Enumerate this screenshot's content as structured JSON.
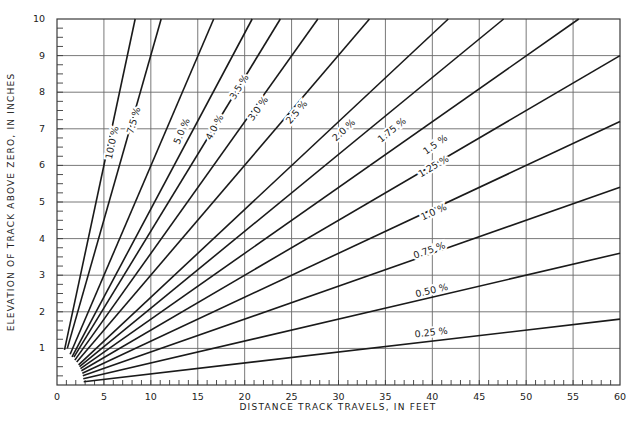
{
  "chart_data": {
    "type": "line",
    "title": "",
    "xlabel": "DISTANCE TRACK TRAVELS, IN FEET",
    "ylabel": "ELEVATION OF TRACK ABOVE ZERO, IN INCHES",
    "xlim": [
      0,
      60
    ],
    "ylim": [
      0,
      10
    ],
    "x_ticks": [
      0,
      5,
      10,
      15,
      20,
      25,
      30,
      35,
      40,
      45,
      50,
      55,
      60
    ],
    "y_ticks": [
      1,
      2,
      3,
      4,
      5,
      6,
      7,
      8,
      9,
      10
    ],
    "x_minor_step": 1,
    "y_minor_step": 0.25,
    "grid": true,
    "legend": "inline labels along lines",
    "relationship": "elevation_in = grade_pct / 100 * distance_ft * 12",
    "series": [
      {
        "name": "10.0 %",
        "grade": 10.0,
        "x": [
          0.8,
          8.33
        ],
        "y": [
          0.96,
          10.0
        ],
        "label_at": [
          6.2,
          6.6
        ]
      },
      {
        "name": "7.5 %",
        "grade": 7.5,
        "x": [
          1.1,
          11.1
        ],
        "y": [
          1.0,
          10.0
        ],
        "label_at": [
          8.5,
          7.2
        ]
      },
      {
        "name": "5.0 %",
        "grade": 5.0,
        "x": [
          1.4,
          16.7
        ],
        "y": [
          0.84,
          10.0
        ],
        "label_at": [
          13.6,
          6.9
        ]
      },
      {
        "name": "4.0 %",
        "grade": 4.0,
        "x": [
          1.6,
          20.8
        ],
        "y": [
          0.77,
          10.0
        ],
        "label_at": [
          17.1,
          7.0
        ]
      },
      {
        "name": "3.5 %",
        "grade": 3.5,
        "x": [
          1.8,
          23.8
        ],
        "y": [
          0.76,
          10.0
        ],
        "label_at": [
          19.7,
          8.1
        ]
      },
      {
        "name": "3.0 %",
        "grade": 3.0,
        "x": [
          1.9,
          27.8
        ],
        "y": [
          0.68,
          10.0
        ],
        "label_at": [
          21.7,
          7.5
        ]
      },
      {
        "name": "2.5 %",
        "grade": 2.5,
        "x": [
          2.1,
          33.3
        ],
        "y": [
          0.63,
          10.0
        ],
        "label_at": [
          25.8,
          7.4
        ]
      },
      {
        "name": "2.0 %",
        "grade": 2.0,
        "x": [
          2.3,
          41.7
        ],
        "y": [
          0.55,
          10.0
        ],
        "label_at": [
          30.8,
          6.9
        ]
      },
      {
        "name": "1.75 %",
        "grade": 1.75,
        "x": [
          2.4,
          47.6
        ],
        "y": [
          0.5,
          10.0
        ],
        "label_at": [
          35.9,
          6.9
        ]
      },
      {
        "name": "1.5 %",
        "grade": 1.5,
        "x": [
          2.5,
          55.6
        ],
        "y": [
          0.45,
          10.0
        ],
        "label_at": [
          40.5,
          6.5
        ]
      },
      {
        "name": "1.25 %",
        "grade": 1.25,
        "x": [
          2.6,
          60
        ],
        "y": [
          0.39,
          9.0
        ],
        "label_at": [
          40.3,
          5.9
        ]
      },
      {
        "name": "1.0 %",
        "grade": 1.0,
        "x": [
          2.7,
          60
        ],
        "y": [
          0.32,
          7.2
        ],
        "label_at": [
          40.3,
          4.65
        ]
      },
      {
        "name": "0.75 %",
        "grade": 0.75,
        "x": [
          2.75,
          60
        ],
        "y": [
          0.25,
          5.4
        ],
        "label_at": [
          39.8,
          3.6
        ]
      },
      {
        "name": "0.50 %",
        "grade": 0.5,
        "x": [
          2.8,
          60
        ],
        "y": [
          0.17,
          3.6
        ],
        "label_at": [
          40.0,
          2.5
        ]
      },
      {
        "name": "0.25 %",
        "grade": 0.25,
        "x": [
          2.85,
          60
        ],
        "y": [
          0.09,
          1.8
        ],
        "label_at": [
          39.9,
          1.35
        ]
      }
    ]
  },
  "plot_area": {
    "left": 57,
    "top": 19,
    "right": 620,
    "bottom": 385
  }
}
